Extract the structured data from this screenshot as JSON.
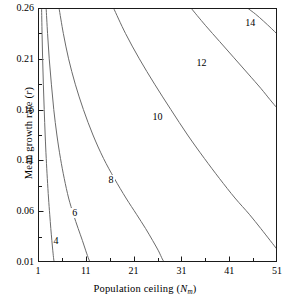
{
  "chart_data": {
    "type": "line",
    "title": "",
    "xlabel": "Population ceiling (Nₘ)",
    "xlabel_main": "Population ceiling (",
    "xlabel_var": "N",
    "xlabel_sub": "m",
    "xlabel_end": ")",
    "ylabel": "Mean growth rate (r)",
    "ylabel_main": "Mean growth rate (",
    "ylabel_var": "r",
    "ylabel_end": ")",
    "xlim": [
      1,
      51
    ],
    "ylim": [
      0.01,
      0.26
    ],
    "xticks": [
      1,
      11,
      21,
      31,
      41,
      51
    ],
    "xtick_labels": [
      "1",
      "11",
      "21",
      "31",
      "41",
      "51"
    ],
    "xminor_ticks": [
      6,
      16,
      26,
      36,
      46
    ],
    "yticks": [
      0.01,
      0.06,
      0.11,
      0.16,
      0.21,
      0.26
    ],
    "ytick_labels": [
      "0.01",
      "0.06",
      "0.11",
      "0.16",
      "0.21",
      "0.26"
    ],
    "yminor_ticks": [
      0.035,
      0.085,
      0.135,
      0.185,
      0.235
    ],
    "grid": false,
    "legend": "none",
    "contour_levels": [
      4,
      6,
      8,
      10,
      12,
      14
    ],
    "line_color": "#6b6b6b",
    "axis_color": "#1a1a1a",
    "series": [
      {
        "name": "4",
        "label": "4",
        "label_x": 5.1,
        "label_y": 0.0295,
        "points": [
          [
            1.75,
            0.26
          ],
          [
            1.85,
            0.235
          ],
          [
            1.97,
            0.21
          ],
          [
            2.12,
            0.185
          ],
          [
            2.3,
            0.16
          ],
          [
            2.5,
            0.135
          ],
          [
            2.72,
            0.112
          ],
          [
            2.95,
            0.092
          ],
          [
            3.2,
            0.073
          ],
          [
            3.45,
            0.057
          ],
          [
            3.68,
            0.043
          ],
          [
            3.9,
            0.031
          ],
          [
            4.1,
            0.021
          ],
          [
            4.28,
            0.013
          ],
          [
            4.4,
            0.01
          ]
        ]
      },
      {
        "name": "6",
        "label": "6",
        "label_x": 9.0,
        "label_y": 0.057,
        "points": [
          [
            2.7,
            0.26
          ],
          [
            3.0,
            0.235
          ],
          [
            3.35,
            0.21
          ],
          [
            3.8,
            0.185
          ],
          [
            4.3,
            0.16
          ],
          [
            4.95,
            0.135
          ],
          [
            5.7,
            0.112
          ],
          [
            6.5,
            0.092
          ],
          [
            7.4,
            0.073
          ],
          [
            8.4,
            0.057
          ],
          [
            9.4,
            0.043
          ],
          [
            10.3,
            0.031
          ],
          [
            11.0,
            0.021
          ],
          [
            11.6,
            0.013
          ],
          [
            11.9,
            0.01
          ]
        ]
      },
      {
        "name": "8",
        "label": "8",
        "label_x": 16.6,
        "label_y": 0.0895,
        "points": [
          [
            5.4,
            0.26
          ],
          [
            6.3,
            0.235
          ],
          [
            7.4,
            0.21
          ],
          [
            8.8,
            0.185
          ],
          [
            10.5,
            0.16
          ],
          [
            12.5,
            0.135
          ],
          [
            14.7,
            0.112
          ],
          [
            17.0,
            0.092
          ],
          [
            19.4,
            0.073
          ],
          [
            21.6,
            0.057
          ],
          [
            23.5,
            0.043
          ],
          [
            25.0,
            0.031
          ],
          [
            26.2,
            0.021
          ],
          [
            27.0,
            0.013
          ],
          [
            27.4,
            0.01
          ]
        ]
      },
      {
        "name": "10",
        "label": "10",
        "label_x": 25.8,
        "label_y": 0.152,
        "points": [
          [
            16.8,
            0.26
          ],
          [
            19.3,
            0.235
          ],
          [
            22.2,
            0.21
          ],
          [
            25.4,
            0.185
          ],
          [
            28.8,
            0.16
          ],
          [
            32.3,
            0.135
          ],
          [
            35.8,
            0.112
          ],
          [
            39.0,
            0.092
          ],
          [
            42.2,
            0.073
          ],
          [
            45.2,
            0.057
          ],
          [
            47.6,
            0.043
          ],
          [
            49.6,
            0.031
          ],
          [
            51.0,
            0.0225
          ]
        ]
      },
      {
        "name": "12",
        "label": "12",
        "label_x": 35.0,
        "label_y": 0.2045,
        "points": [
          [
            33.0,
            0.26
          ],
          [
            36.0,
            0.243
          ],
          [
            39.0,
            0.227
          ],
          [
            42.0,
            0.211
          ],
          [
            45.0,
            0.195
          ],
          [
            47.6,
            0.181
          ],
          [
            49.5,
            0.17
          ],
          [
            51.0,
            0.1615
          ]
        ]
      },
      {
        "name": "14",
        "label": "14",
        "label_x": 45.2,
        "label_y": 0.2445,
        "points": [
          [
            44.8,
            0.26
          ],
          [
            46.5,
            0.254
          ],
          [
            48.2,
            0.247
          ],
          [
            49.8,
            0.24
          ],
          [
            51.0,
            0.2345
          ]
        ]
      }
    ]
  }
}
